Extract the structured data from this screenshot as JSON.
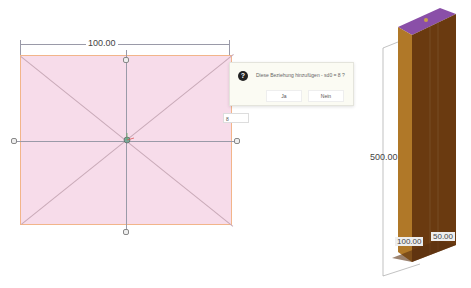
{
  "sketch": {
    "width_dimension": "100.00",
    "input_value": "8",
    "colors": {
      "fill": "#f7dcea",
      "border": "#f2b58a"
    }
  },
  "dialog": {
    "message": "Diese Beziehung hinzufügen - sd0 = 8 ?",
    "yes_label": "Ja",
    "no_label": "Nein"
  },
  "model_3d": {
    "height_dimension": "500.00",
    "base_width_dimension": "100.00",
    "base_depth_dimension": "50.00",
    "colors": {
      "top_face": "#8a4fa8",
      "front_face": "#7a4212",
      "side_face": "#b07828"
    }
  },
  "icons": [
    "question-icon",
    "origin-triad-icon",
    "constraint-marker-icon"
  ]
}
